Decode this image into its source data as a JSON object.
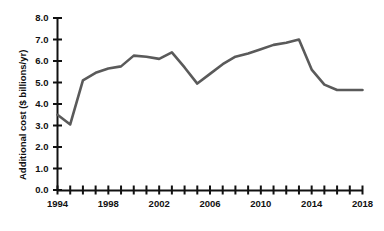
{
  "chart_data": {
    "type": "line",
    "title": "",
    "xlabel": "",
    "ylabel": "Additional cost ($ billions/yr)",
    "xlim": [
      1994,
      2018
    ],
    "ylim": [
      0.0,
      8.0
    ],
    "grid": false,
    "legend": false,
    "line_color": "#5a5a5a",
    "axis_color": "#111111",
    "x_tick_step": 1,
    "x_label_step": 4,
    "y_tick_step": 1.0,
    "x_tick_labels": [
      "1994",
      "1998",
      "2002",
      "2006",
      "2010",
      "2014",
      "2018"
    ],
    "x_tick_values": [
      1994,
      1998,
      2002,
      2006,
      2010,
      2014,
      2018
    ],
    "y_tick_labels": [
      "0.0",
      "1.0",
      "2.0",
      "3.0",
      "4.0",
      "5.0",
      "6.0",
      "7.0",
      "8.0"
    ],
    "y_tick_values": [
      0.0,
      1.0,
      2.0,
      3.0,
      4.0,
      5.0,
      6.0,
      7.0,
      8.0
    ],
    "x": [
      1994,
      1995,
      1996,
      1997,
      1998,
      1999,
      2000,
      2001,
      2002,
      2003,
      2004,
      2005,
      2006,
      2007,
      2008,
      2009,
      2010,
      2011,
      2012,
      2013,
      2014,
      2015,
      2016,
      2017,
      2018
    ],
    "values": [
      3.5,
      3.05,
      5.1,
      5.45,
      5.65,
      5.75,
      6.25,
      6.2,
      6.1,
      6.4,
      5.7,
      4.95,
      5.4,
      5.85,
      6.2,
      6.35,
      6.55,
      6.75,
      6.85,
      7.0,
      5.6,
      4.9,
      4.65,
      4.65,
      4.65
    ],
    "series": [
      {
        "name": "Additional cost",
        "values": [
          3.5,
          3.05,
          5.1,
          5.45,
          5.65,
          5.75,
          6.25,
          6.2,
          6.1,
          6.4,
          5.7,
          4.95,
          5.4,
          5.85,
          6.2,
          6.35,
          6.55,
          6.75,
          6.85,
          7.0,
          5.6,
          4.9,
          4.65,
          4.65,
          4.65
        ]
      }
    ]
  }
}
